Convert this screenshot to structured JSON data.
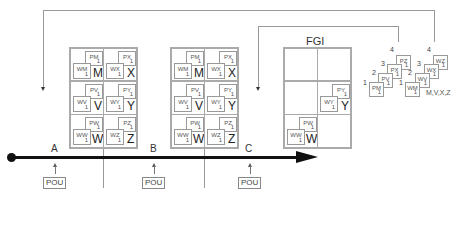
{
  "diagram": {
    "type": "kanban-flow",
    "timeline": {
      "stations": [
        "A",
        "B",
        "C"
      ],
      "pou_label": "POU"
    },
    "boards": [
      {
        "id": "board-1",
        "rows": [
          [
            {
              "p": "PM",
              "w": "WM",
              "qty": "1",
              "item": "M"
            },
            {
              "p": "PX",
              "w": "WX",
              "qty": "1",
              "item": "X"
            }
          ],
          [
            {
              "p": "PV",
              "w": "WV",
              "qty": "1",
              "item": "V"
            },
            {
              "p": "PY",
              "w": "WY",
              "qty": "1",
              "item": "Y"
            }
          ],
          [
            {
              "p": "PW",
              "w": "WW",
              "qty": "1",
              "item": "W"
            },
            {
              "p": "PZ",
              "w": "WZ",
              "qty": "1",
              "item": "Z"
            }
          ]
        ]
      },
      {
        "id": "board-2",
        "rows": [
          [
            {
              "p": "PM",
              "w": "WM",
              "qty": "1",
              "item": "M"
            },
            {
              "p": "PX",
              "w": "WX",
              "qty": "1",
              "item": "X"
            }
          ],
          [
            {
              "p": "PV",
              "w": "WV",
              "qty": "1",
              "item": "V"
            },
            {
              "p": "PY",
              "w": "WY",
              "qty": "1",
              "item": "Y"
            }
          ],
          [
            {
              "p": "PW",
              "w": "WW",
              "qty": "1",
              "item": "W"
            },
            {
              "p": "PZ",
              "w": "WZ",
              "qty": "1",
              "item": "Z"
            }
          ]
        ]
      }
    ],
    "fgi": {
      "title": "FGI",
      "filled": [
        {
          "p": "PY",
          "w": "WY",
          "qty": "1",
          "item": "Y"
        },
        {
          "p": "PW",
          "w": "WW",
          "qty": "1",
          "item": "W"
        }
      ]
    },
    "stacks": {
      "p_stack": [
        {
          "seq": "1",
          "code": "PM",
          "qty": "1"
        },
        {
          "seq": "2",
          "code": "PV",
          "qty": "1"
        },
        {
          "seq": "3",
          "code": "PX",
          "qty": "1"
        },
        {
          "seq": "4",
          "code": "PZ",
          "qty": "1"
        }
      ],
      "w_stack": [
        {
          "seq": "1",
          "code": "WM",
          "qty": "1"
        },
        {
          "seq": "2",
          "code": "WV",
          "qty": "1"
        },
        {
          "seq": "3",
          "code": "WX",
          "qty": "1"
        },
        {
          "seq": "4",
          "code": "WZ",
          "qty": "1"
        }
      ],
      "legend": "M,V,X,Z"
    }
  }
}
